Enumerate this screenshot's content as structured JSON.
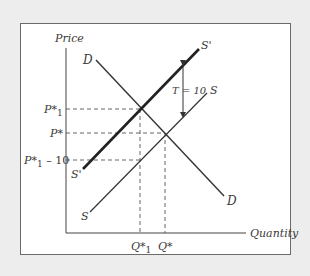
{
  "diagram": {
    "y_axis_label": "Price",
    "x_axis_label": "Quantity",
    "curves": {
      "demand": {
        "label": "D"
      },
      "supply": {
        "label": "S"
      },
      "supply_with_tax": {
        "label": "S'"
      }
    },
    "price_levels": {
      "p1": {
        "base": "P*",
        "sub": "1"
      },
      "p_star": {
        "base": "P*"
      },
      "p1_minus": {
        "base": "P*",
        "sub": "1",
        "suffix": " – 10"
      }
    },
    "quantity_levels": {
      "q1": {
        "base": "Q*",
        "sub": "1"
      },
      "q_star": {
        "base": "Q*"
      }
    },
    "tax_annotation": "T = 10",
    "colors": {
      "line": "#333333",
      "dashed": "#555555",
      "background": "#ededed",
      "panel": "#ffffff"
    }
  }
}
